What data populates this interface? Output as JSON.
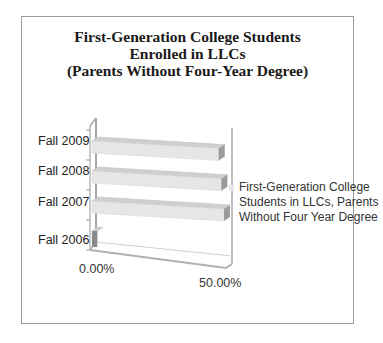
{
  "chart_data": {
    "type": "bar",
    "orientation": "horizontal",
    "style": "3d",
    "title": [
      "First-Generation College Students",
      "Enrolled in LLCs",
      "(Parents Without Four-Year Degree)"
    ],
    "categories": [
      "Fall 2006",
      "Fall 2007",
      "Fall 2008",
      "Fall 2009"
    ],
    "series": [
      {
        "name": "First-Generation College Students in LLCs, Parents Without Four Year Degree",
        "values": [
          0.02,
          0.5,
          0.49,
          0.48
        ],
        "color": "#e6e6e6"
      }
    ],
    "xlabel": "",
    "ylabel": "",
    "xlim": [
      0,
      0.5
    ],
    "x_ticks": [
      "0.00%",
      "50.00%"
    ],
    "legend_position": "right",
    "legend_lines": [
      "First-Generation College",
      "Students in LLCs, Parents",
      "Without Four Year Degree"
    ],
    "grid": false
  }
}
